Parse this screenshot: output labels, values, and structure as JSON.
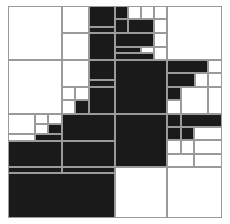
{
  "figure": {
    "type": "quadtree-decomposition",
    "title": "",
    "frame": {
      "x": 8,
      "y": 6,
      "width": 214,
      "height": 212
    },
    "colors": {
      "black": "#1a1a1a",
      "white": "#ffffff",
      "grid_line": "#9a9a9a",
      "background": "#ffffff"
    },
    "legend": {
      "black_label": "occupied",
      "white_label": "empty"
    },
    "counts": {
      "black_cells": 44,
      "white_cells": 36,
      "total_cells": 80
    },
    "cells": [
      {
        "x": 8,
        "y": 6,
        "w": 54,
        "h": 54,
        "v": "white"
      },
      {
        "x": 62,
        "y": 6,
        "w": 27,
        "h": 27,
        "v": "white"
      },
      {
        "x": 62,
        "y": 33,
        "w": 27,
        "h": 27,
        "v": "white"
      },
      {
        "x": 89,
        "y": 6,
        "w": 26,
        "h": 21,
        "v": "black"
      },
      {
        "x": 89,
        "y": 27,
        "w": 26,
        "h": 6,
        "v": "black"
      },
      {
        "x": 89,
        "y": 33,
        "w": 26,
        "h": 27,
        "v": "black"
      },
      {
        "x": 115,
        "y": 6,
        "w": 13,
        "h": 13,
        "v": "black"
      },
      {
        "x": 128,
        "y": 6,
        "w": 13,
        "h": 13,
        "v": "white"
      },
      {
        "x": 141,
        "y": 6,
        "w": 13,
        "h": 13,
        "v": "white"
      },
      {
        "x": 154,
        "y": 6,
        "w": 13,
        "h": 13,
        "v": "white"
      },
      {
        "x": 115,
        "y": 19,
        "w": 13,
        "h": 14,
        "v": "black"
      },
      {
        "x": 128,
        "y": 19,
        "w": 26,
        "h": 14,
        "v": "black"
      },
      {
        "x": 154,
        "y": 19,
        "w": 13,
        "h": 14,
        "v": "white"
      },
      {
        "x": 115,
        "y": 33,
        "w": 39,
        "h": 14,
        "v": "black"
      },
      {
        "x": 154,
        "y": 33,
        "w": 13,
        "h": 14,
        "v": "white"
      },
      {
        "x": 115,
        "y": 47,
        "w": 26,
        "h": 6,
        "v": "black"
      },
      {
        "x": 141,
        "y": 47,
        "w": 13,
        "h": 6,
        "v": "white"
      },
      {
        "x": 115,
        "y": 53,
        "w": 39,
        "h": 7,
        "v": "black"
      },
      {
        "x": 154,
        "y": 47,
        "w": 13,
        "h": 13,
        "v": "white"
      },
      {
        "x": 167,
        "y": 6,
        "w": 55,
        "h": 54,
        "v": "white"
      },
      {
        "x": 8,
        "y": 60,
        "w": 54,
        "h": 54,
        "v": "white"
      },
      {
        "x": 62,
        "y": 60,
        "w": 27,
        "h": 27,
        "v": "white"
      },
      {
        "x": 62,
        "y": 87,
        "w": 13,
        "h": 13,
        "v": "white"
      },
      {
        "x": 75,
        "y": 87,
        "w": 14,
        "h": 13,
        "v": "white"
      },
      {
        "x": 62,
        "y": 100,
        "w": 13,
        "h": 14,
        "v": "white"
      },
      {
        "x": 75,
        "y": 100,
        "w": 14,
        "h": 14,
        "v": "black"
      },
      {
        "x": 89,
        "y": 60,
        "w": 26,
        "h": 20,
        "v": "black"
      },
      {
        "x": 89,
        "y": 80,
        "w": 26,
        "h": 7,
        "v": "black"
      },
      {
        "x": 89,
        "y": 87,
        "w": 26,
        "h": 27,
        "v": "black"
      },
      {
        "x": 115,
        "y": 60,
        "w": 52,
        "h": 54,
        "v": "black"
      },
      {
        "x": 167,
        "y": 60,
        "w": 41,
        "h": 13,
        "v": "black"
      },
      {
        "x": 208,
        "y": 60,
        "w": 14,
        "h": 13,
        "v": "white"
      },
      {
        "x": 167,
        "y": 73,
        "w": 28,
        "h": 14,
        "v": "black"
      },
      {
        "x": 195,
        "y": 73,
        "w": 13,
        "h": 14,
        "v": "white"
      },
      {
        "x": 208,
        "y": 73,
        "w": 14,
        "h": 14,
        "v": "white"
      },
      {
        "x": 167,
        "y": 87,
        "w": 14,
        "h": 13,
        "v": "black"
      },
      {
        "x": 181,
        "y": 87,
        "w": 27,
        "h": 27,
        "v": "white"
      },
      {
        "x": 208,
        "y": 87,
        "w": 14,
        "h": 27,
        "v": "white"
      },
      {
        "x": 167,
        "y": 100,
        "w": 14,
        "h": 14,
        "v": "white"
      },
      {
        "x": 8,
        "y": 114,
        "w": 27,
        "h": 20,
        "v": "white"
      },
      {
        "x": 35,
        "y": 114,
        "w": 13,
        "h": 10,
        "v": "white"
      },
      {
        "x": 48,
        "y": 114,
        "w": 14,
        "h": 10,
        "v": "white"
      },
      {
        "x": 35,
        "y": 124,
        "w": 13,
        "h": 10,
        "v": "white"
      },
      {
        "x": 48,
        "y": 124,
        "w": 14,
        "h": 10,
        "v": "black"
      },
      {
        "x": 8,
        "y": 134,
        "w": 27,
        "h": 7,
        "v": "white"
      },
      {
        "x": 35,
        "y": 134,
        "w": 27,
        "h": 7,
        "v": "black"
      },
      {
        "x": 62,
        "y": 114,
        "w": 53,
        "h": 27,
        "v": "black"
      },
      {
        "x": 8,
        "y": 141,
        "w": 54,
        "h": 26,
        "v": "black"
      },
      {
        "x": 62,
        "y": 141,
        "w": 53,
        "h": 26,
        "v": "black"
      },
      {
        "x": 115,
        "y": 114,
        "w": 52,
        "h": 53,
        "v": "black"
      },
      {
        "x": 167,
        "y": 114,
        "w": 14,
        "h": 13,
        "v": "black"
      },
      {
        "x": 181,
        "y": 114,
        "w": 41,
        "h": 13,
        "v": "black"
      },
      {
        "x": 167,
        "y": 127,
        "w": 14,
        "h": 13,
        "v": "black"
      },
      {
        "x": 181,
        "y": 127,
        "w": 13,
        "h": 13,
        "v": "black"
      },
      {
        "x": 194,
        "y": 127,
        "w": 28,
        "h": 13,
        "v": "white"
      },
      {
        "x": 167,
        "y": 140,
        "w": 14,
        "h": 14,
        "v": "white"
      },
      {
        "x": 181,
        "y": 140,
        "w": 13,
        "h": 14,
        "v": "white"
      },
      {
        "x": 194,
        "y": 140,
        "w": 28,
        "h": 14,
        "v": "white"
      },
      {
        "x": 167,
        "y": 154,
        "w": 27,
        "h": 13,
        "v": "white"
      },
      {
        "x": 194,
        "y": 154,
        "w": 28,
        "h": 13,
        "v": "white"
      },
      {
        "x": 8,
        "y": 167,
        "w": 54,
        "h": 6,
        "v": "black"
      },
      {
        "x": 62,
        "y": 167,
        "w": 53,
        "h": 6,
        "v": "black"
      },
      {
        "x": 8,
        "y": 173,
        "w": 107,
        "h": 45,
        "v": "black"
      },
      {
        "x": 115,
        "y": 167,
        "w": 52,
        "h": 51,
        "v": "white"
      },
      {
        "x": 167,
        "y": 167,
        "w": 55,
        "h": 51,
        "v": "white"
      }
    ]
  }
}
